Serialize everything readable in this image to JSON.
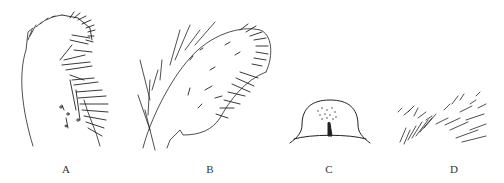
{
  "figure": {
    "panels": [
      {
        "label": "A",
        "x": 66,
        "description": "dorsal view of appendage with setae (left)"
      },
      {
        "label": "B",
        "x": 210,
        "description": "appendage with dense apical setae and branched hairs"
      },
      {
        "label": "C",
        "x": 329,
        "description": "dome-shaped plate with punctures and median ridge"
      },
      {
        "label": "D",
        "x": 454,
        "description": "setal patch, paired fields"
      }
    ],
    "stroke_color": "#222222"
  }
}
